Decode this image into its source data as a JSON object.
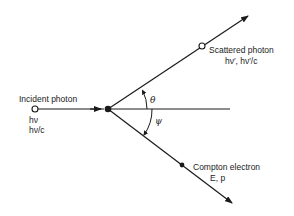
{
  "colors": {
    "ink": "#1a1a1a",
    "background": "#ffffff"
  },
  "incident": {
    "label": "Incident photon",
    "energy": "hν",
    "momentum": "hν/c",
    "marker": "open-circle"
  },
  "scattered": {
    "label": "Scattered photon",
    "quantities": "hν′, hν′/c",
    "marker": "open-circle"
  },
  "electron": {
    "label": "Compton electron",
    "quantities": "E, p",
    "marker": "filled-circle"
  },
  "angles": {
    "photon_angle": "θ",
    "electron_angle": "ψ"
  }
}
